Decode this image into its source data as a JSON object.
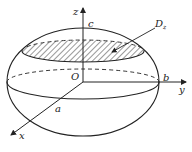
{
  "diagram": {
    "type": "ellipsoid-cross-section",
    "labels": {
      "z_axis": "z",
      "y_axis": "y",
      "x_axis": "x",
      "origin": "O",
      "semi_axis_c": "c",
      "semi_axis_b": "b",
      "semi_axis_a": "a",
      "region": "D",
      "region_subscript": "z"
    },
    "colors": {
      "stroke": "#222222",
      "background": "#ffffff"
    }
  }
}
